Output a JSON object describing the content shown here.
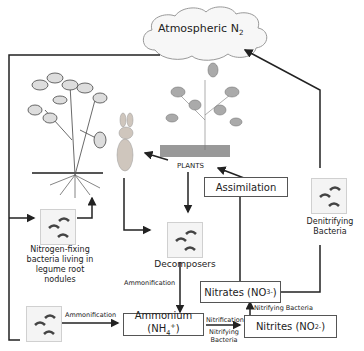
{
  "diagram": {
    "nodes": {
      "atmosphere": {
        "label": "Atmospheric N",
        "sub": "2"
      },
      "plants": {
        "label": "PLANTS"
      },
      "assimilation": {
        "label": "Assimilation"
      },
      "denitrifying": {
        "label": "Denitrifying Bacteria"
      },
      "nitrogen_fixing": {
        "label": "Nitrogen-fixing bacteria living in legume root nodules"
      },
      "decomposers": {
        "label": "Decomposers"
      },
      "ammonium": {
        "label": "Ammonium",
        "formula": "(NH",
        "sub": "4",
        "sup": "+",
        "close": ")"
      },
      "nitrates": {
        "label": "Nitrates (NO",
        "sub": "3",
        "sup": "-",
        "close": ")"
      },
      "nitrites": {
        "label": "Nitrites (NO",
        "sub": "2",
        "sup": "-",
        "close": ")"
      }
    },
    "edge_labels": {
      "ammonification_1": "Ammonification",
      "ammonification_2": "Ammonification",
      "nitrification": "Nitrification",
      "nitrifying_bacteria_1": "Nitrifying Bacteria",
      "nitrifying_bacteria_2": "Nitrifying Bacteria"
    },
    "images": [
      "legume-plant",
      "rabbit",
      "plant",
      "bacteria-icon"
    ],
    "colors": {
      "line": "#222222",
      "cloud_fill": "#f7f7f7",
      "box_border": "#555555"
    }
  }
}
